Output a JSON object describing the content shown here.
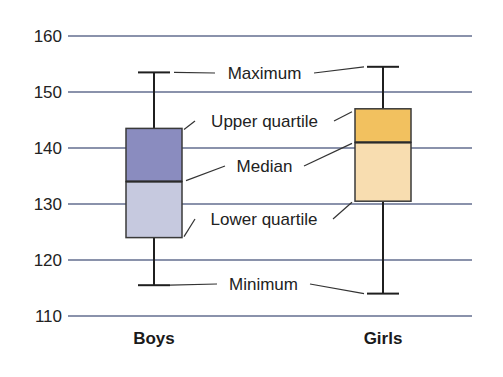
{
  "chart_data": {
    "type": "boxplot",
    "title": "",
    "xlabel": "",
    "ylabel": "",
    "ylim": [
      110,
      160
    ],
    "yticks": [
      110,
      120,
      130,
      140,
      150,
      160
    ],
    "grid": true,
    "categories": [
      "Boys",
      "Girls"
    ],
    "series": [
      {
        "name": "Boys",
        "min": 115.5,
        "q1": 124,
        "median": 134,
        "q3": 143.5,
        "max": 153.5,
        "upper_color": "#8a8cbf",
        "lower_color": "#c6c9df"
      },
      {
        "name": "Girls",
        "min": 114,
        "q1": 130.5,
        "median": 141,
        "q3": 147,
        "max": 154.5,
        "upper_color": "#f2c15f",
        "lower_color": "#f8ddb0"
      }
    ],
    "annotations": [
      {
        "label": "Maximum",
        "stat": "max"
      },
      {
        "label": "Upper quartile",
        "stat": "q3"
      },
      {
        "label": "Median",
        "stat": "median"
      },
      {
        "label": "Lower quartile",
        "stat": "q1"
      },
      {
        "label": "Minimum",
        "stat": "min"
      }
    ]
  }
}
